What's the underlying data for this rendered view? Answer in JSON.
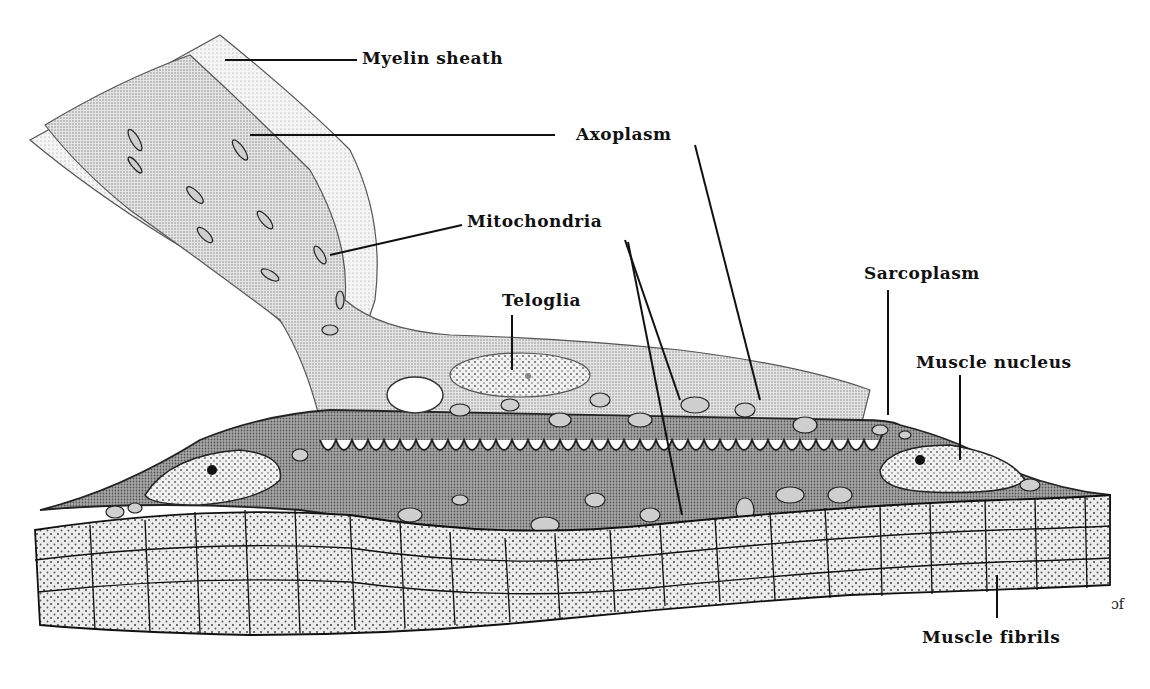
{
  "diagram": {
    "labels": {
      "myelin_sheath": "Myelin sheath",
      "axoplasm": "Axoplasm",
      "mitochondria": "Mitochondria",
      "teloglia": "Teloglia",
      "sarcoplasm": "Sarcoplasm",
      "muscle_nucleus": "Muscle nucleus",
      "muscle_fibrils": "Muscle fibrils"
    },
    "signature": "ɔf",
    "colors": {
      "ink": "#111111",
      "axon_fill": "#d9d9d9",
      "myelin_fill": "#ececec",
      "sarcoplasm_fill": "#9a9a9a",
      "nucleus_fill": "#e6e6e6",
      "fibril_fill": "#e2e2e2",
      "background": "#ffffff"
    }
  }
}
